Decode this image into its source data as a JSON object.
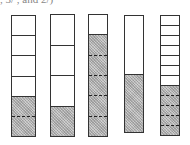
{
  "caption": ", 3/ , and 2/)",
  "diagram": {
    "type": "fraction-bars",
    "shade_color": "#bdbdbd",
    "bars": [
      {
        "id": "bar-1",
        "parts": 6,
        "shaded": 2,
        "fraction": "2/6",
        "x": 11,
        "y": 15,
        "w": 25,
        "h": 122
      },
      {
        "id": "bar-2",
        "parts": 4,
        "shaded": 1,
        "fraction": "1/4",
        "x": 50,
        "y": 14,
        "w": 25,
        "h": 123
      },
      {
        "id": "bar-3",
        "parts": 6,
        "shaded": 5,
        "fraction": "5/6",
        "x": 88,
        "y": 14,
        "w": 20,
        "h": 123
      },
      {
        "id": "bar-4",
        "parts": 2,
        "shaded": 1,
        "fraction": "1/2",
        "x": 124,
        "y": 15,
        "w": 20,
        "h": 118
      },
      {
        "id": "bar-5",
        "parts": 12,
        "shaded": 5,
        "fraction": "5/12",
        "x": 160,
        "y": 15,
        "w": 20,
        "h": 121
      }
    ]
  }
}
